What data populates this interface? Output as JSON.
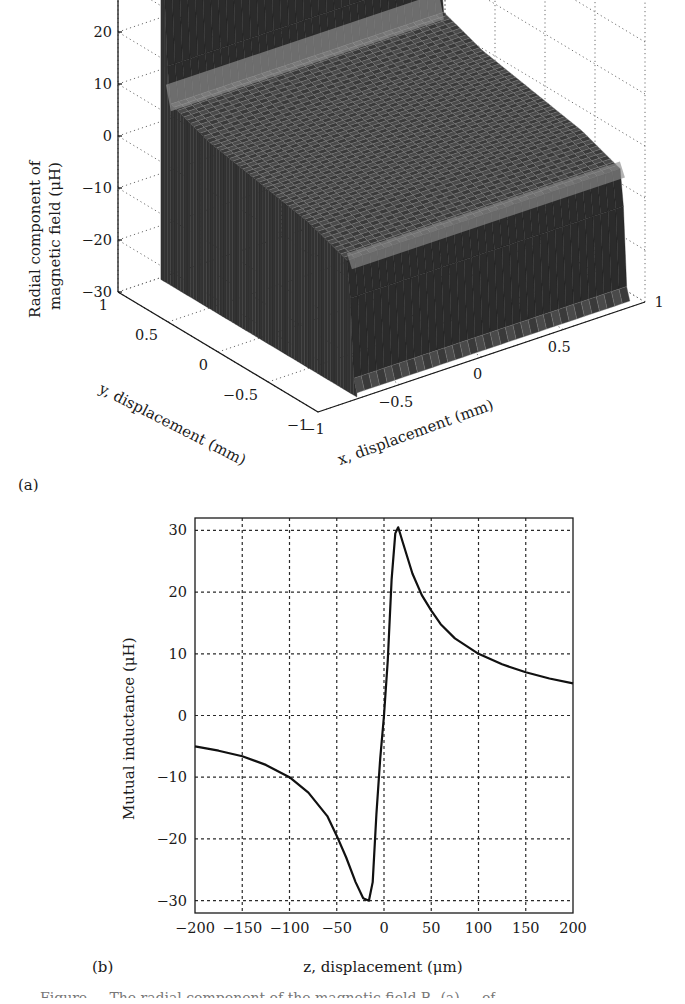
{
  "figure": {
    "panel_a_label": "(a)",
    "panel_b_label": "(b)",
    "caption_fragment": "Figure ... The radial component of the magnetic field Bᵣ (a) ... of"
  },
  "chart_data": [
    {
      "type": "surface3d",
      "panel": "(a)",
      "title": "",
      "zlabel_line1": "Radial component of",
      "zlabel_line2": "magnetic field (μH)",
      "xlabel": "x, displacement (mm)",
      "ylabel": "y, displacement (mm)",
      "z_ticks": [
        "30",
        "20",
        "10",
        "0",
        "−10",
        "−20",
        "−30"
      ],
      "z_values": [
        30,
        20,
        10,
        0,
        -10,
        -20,
        -30
      ],
      "x_ticks": [
        "−1",
        "−0.5",
        "0",
        "0.5",
        "1"
      ],
      "y_ticks": [
        "1",
        "0.5",
        "0",
        "−0.5",
        "−1"
      ],
      "xlim": [
        -1,
        1
      ],
      "ylim": [
        -1,
        1
      ],
      "zlim": [
        -30,
        30
      ],
      "grid": true,
      "description": "Step-like surface: ~-30 plateau wall at y near -1 edge, ~0 flat region across center, ~+30 wall at far edge",
      "surface_profile": {
        "along": "y",
        "y": [
          -1,
          -0.95,
          -0.9,
          -0.5,
          0,
          0.5,
          0.9,
          0.95,
          1
        ],
        "z": [
          -30,
          -28,
          -5,
          -2,
          0,
          2,
          5,
          28,
          30
        ]
      }
    },
    {
      "type": "line",
      "panel": "(b)",
      "title": "",
      "xlabel": "z, displacement (μm)",
      "ylabel": "Mutual inductance (μH)",
      "xlim": [
        -200,
        200
      ],
      "ylim": [
        -32,
        32
      ],
      "x_ticks": [
        "−200",
        "−150",
        "−100",
        "−50",
        "0",
        "50",
        "100",
        "150",
        "200"
      ],
      "x_tick_values": [
        -200,
        -150,
        -100,
        -50,
        0,
        50,
        100,
        150,
        200
      ],
      "y_ticks": [
        "30",
        "20",
        "10",
        "0",
        "−10",
        "−20",
        "−30"
      ],
      "y_tick_values": [
        30,
        20,
        10,
        0,
        -10,
        -20,
        -30
      ],
      "grid": true,
      "series": [
        {
          "name": "Mutual inductance",
          "x": [
            -200,
            -175,
            -150,
            -125,
            -100,
            -80,
            -60,
            -50,
            -40,
            -30,
            -22,
            -16,
            -12,
            -8,
            -4,
            0,
            4,
            8,
            12,
            15,
            20,
            30,
            40,
            50,
            60,
            75,
            100,
            125,
            150,
            175,
            200
          ],
          "y": [
            -5,
            -5.7,
            -6.6,
            -8,
            -10,
            -12.5,
            -16.3,
            -19.5,
            -23,
            -27,
            -29.6,
            -30,
            -27,
            -16,
            -7,
            0,
            9,
            22,
            29.5,
            30.5,
            28,
            23,
            19.5,
            17,
            14.8,
            12.5,
            10,
            8.3,
            7,
            6,
            5.2
          ]
        }
      ]
    }
  ]
}
